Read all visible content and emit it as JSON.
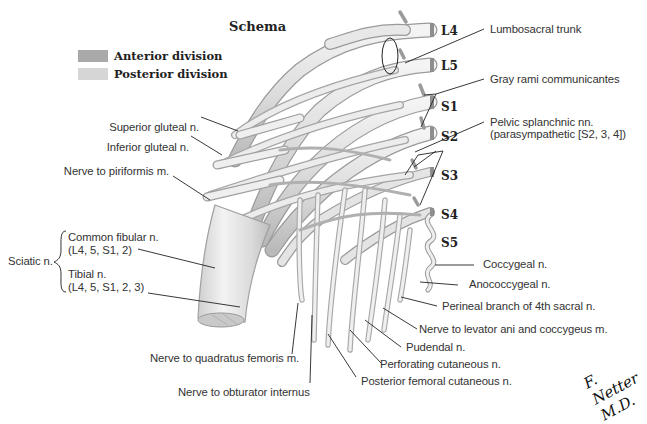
{
  "title": "Schema",
  "legend": [
    {
      "label": "Anterior division",
      "color": "#a9a9a9"
    },
    {
      "label": "Posterior division",
      "color": "#d6d6d6"
    }
  ],
  "segments": [
    "L4",
    "L5",
    "S1",
    "S2",
    "S3",
    "S4",
    "S5"
  ],
  "labels_right": {
    "lumbosacral_trunk": "Lumbosacral trunk",
    "gray_rami": "Gray rami communicantes",
    "pelvic_splanchnic_1": "Pelvic splanchnic nn.",
    "pelvic_splanchnic_2": "(parasympathetic [S2, 3, 4])",
    "coccygeal": "Coccygeal n.",
    "anococcygeal": "Anococcygeal n.",
    "perineal_branch": "Perineal branch of 4th sacral n.",
    "levator_ani": "Nerve to levator ani and coccygeus m.",
    "pudendal": "Pudendal n.",
    "perforating_cutaneous": "Perforating cutaneous n.",
    "posterior_femoral_cutaneous": "Posterior femoral cutaneous n."
  },
  "labels_left": {
    "superior_gluteal": "Superior gluteal n.",
    "inferior_gluteal": "Inferior gluteal n.",
    "piriformis": "Nerve to piriformis m.",
    "sciatic": "Sciatic n.",
    "common_fibular_1": "Common fibular n.",
    "common_fibular_2": "(L4, 5, S1, 2)",
    "tibial_1": "Tibial n.",
    "tibial_2": "(L4, 5, S1, 2, 3)"
  },
  "labels_bottom": {
    "quadratus_femoris": "Nerve to quadratus femoris m.",
    "obturator_internus": "Nerve to obturator internus"
  },
  "signature": "F. Netter M.D."
}
